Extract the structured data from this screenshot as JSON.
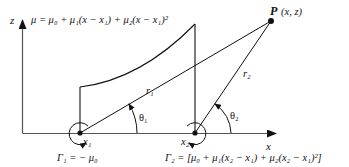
{
  "figure": {
    "axes": {
      "x_label": "x",
      "z_label": "z"
    },
    "point_P": {
      "label_P": "P",
      "label_coords": "(x, z)"
    },
    "distribution_equation": "μ = μ₀ + μ₁(x − x₁) + μ₂(x − x₁)²",
    "vortex_1": {
      "position_label": "x₁",
      "circulation_label": "Γ₁ = − μ₀"
    },
    "vortex_2": {
      "position_label": "x₂",
      "circulation_label": "Γ₂ = [μ₀ + μ₁(x₂ − x₁) + μ₂(x₂ − x₁)²]"
    },
    "distances": {
      "r1": "r₁",
      "r2": "r₂"
    },
    "angles": {
      "theta1": "θ₁",
      "theta2": "θ₂"
    },
    "colors": {
      "line": "#111111",
      "axis": "#555555",
      "background": "#ffffff"
    }
  }
}
